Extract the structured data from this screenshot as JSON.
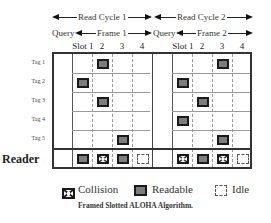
{
  "header": {
    "read_cycles": [
      "Read Cycle 1",
      "Read Cycle 2"
    ],
    "query_label": "Query",
    "frames": [
      "Frame 1",
      "Frame 2"
    ],
    "slot_labels": [
      "Slot 1",
      "2",
      "3",
      "4"
    ]
  },
  "rows": {
    "tags": [
      "Tag 1",
      "Tag 2",
      "Tag 3",
      "Tag 4",
      "Tag 5"
    ],
    "reader": "Reader"
  },
  "frames": [
    {
      "name": "Frame 1",
      "tag_slots": [
        2,
        1,
        2,
        null,
        3
      ],
      "reader_slots": [
        "readable",
        "collision",
        "readable",
        "idle"
      ]
    },
    {
      "name": "Frame 2",
      "tag_slots": [
        3,
        1,
        2,
        1,
        3
      ],
      "reader_slots": [
        "collision",
        "readable",
        "collision",
        "idle"
      ]
    }
  ],
  "legend": {
    "collision": "Collision",
    "readable": "Readable",
    "idle": "Idle"
  },
  "caption": "Framed Slotted ALOHA Algorithm.",
  "colors": {
    "readable_fill": "#7d7d7d",
    "border": "#1a1a1a"
  }
}
